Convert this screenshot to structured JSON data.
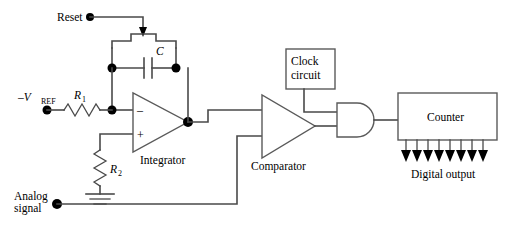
{
  "diagram": {
    "background_color": "#ffffff",
    "wire_color": "#4a4a4a",
    "node_color": "#000000"
  },
  "labels": {
    "reset": "Reset",
    "capacitor": "C",
    "vref": "–V",
    "vref_sub": "REF",
    "r1": "R",
    "r1_sub": "1",
    "r2": "R",
    "r2_sub": "2",
    "opamp_minus": "–",
    "opamp_plus": "+",
    "integrator": "Integrator",
    "comparator": "Comparator",
    "clock_line1": "Clock",
    "clock_line2": "circuit",
    "counter": "Counter",
    "digital_output": "Digital output",
    "analog_line1": "Analog",
    "analog_line2": "signal"
  },
  "components": {
    "reset_terminal": "reset-input-terminal",
    "analog_terminal": "analog-signal-terminal",
    "vref_terminal": "vref-input-terminal",
    "reset_switch": "reset-switch",
    "capacitor_symbol": "capacitor-c",
    "resistor_r1": "resistor-r1",
    "resistor_r2": "resistor-r2",
    "ground_symbol": "ground",
    "integrator_opamp": "integrator-opamp",
    "comparator_opamp": "comparator",
    "clock_block": "clock-circuit-block",
    "and_gate": "and-gate",
    "counter_block": "counter-block",
    "output_bus_count": 8
  },
  "output_bus": {
    "count": 8,
    "x_positions": [
      406,
      417,
      428,
      439,
      450,
      461,
      472,
      483
    ]
  }
}
